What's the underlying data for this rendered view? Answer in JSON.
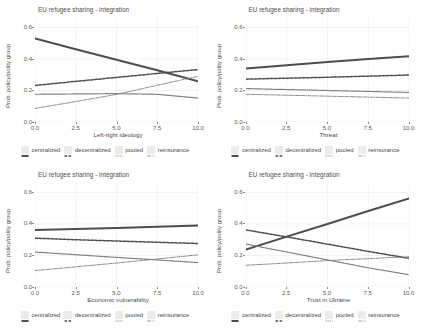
{
  "chart_data": [
    {
      "type": "line",
      "panel": "top-left",
      "title": "EU refugee sharing - integration",
      "xlabel": "Left-right ideology",
      "ylabel": "Prob. policy/polity group",
      "xlim": [
        0,
        10
      ],
      "ylim": [
        0,
        0.66
      ],
      "xticks": [
        "0.0",
        "2.5",
        "5.0",
        "7.5",
        "10.0"
      ],
      "xtickvals": [
        0,
        2.5,
        5,
        7.5,
        10
      ],
      "yticks": [
        "0.0",
        "0.2",
        "0.4",
        "0.6"
      ],
      "ytickvals": [
        0,
        0.2,
        0.4,
        0.6
      ],
      "grid": true,
      "legend_position": "bottom",
      "x": [
        0,
        2.5,
        5,
        7.5,
        10
      ],
      "series": [
        {
          "name": "centralized",
          "style": "solid",
          "values": [
            0.53,
            0.462,
            0.395,
            0.328,
            0.258
          ]
        },
        {
          "name": "decentralized",
          "style": "dashed",
          "values": [
            0.232,
            0.258,
            0.283,
            0.308,
            0.333
          ]
        },
        {
          "name": "pooled",
          "style": "dotted",
          "values": [
            0.176,
            0.178,
            0.18,
            0.176,
            0.152
          ]
        },
        {
          "name": "reinsurance",
          "style": "dashdot",
          "values": [
            0.086,
            0.13,
            0.175,
            0.233,
            0.29
          ]
        }
      ]
    },
    {
      "type": "line",
      "panel": "top-right",
      "title": "EU refugee sharing - integration",
      "xlabel": "Threat",
      "ylabel": "Prob. policy/polity group",
      "xlim": [
        0,
        10
      ],
      "ylim": [
        0,
        0.66
      ],
      "xticks": [
        "0.0",
        "2.5",
        "5.0",
        "7.5",
        "10.0"
      ],
      "xtickvals": [
        0,
        2.5,
        5,
        7.5,
        10
      ],
      "yticks": [
        "0.0",
        "0.2",
        "0.4",
        "0.6"
      ],
      "ytickvals": [
        0,
        0.2,
        0.4,
        0.6
      ],
      "grid": true,
      "legend_position": "bottom",
      "x": [
        0,
        2.5,
        5,
        7.5,
        10
      ],
      "series": [
        {
          "name": "centralized",
          "style": "solid",
          "values": [
            0.34,
            0.36,
            0.38,
            0.4,
            0.418
          ]
        },
        {
          "name": "decentralized",
          "style": "dashed",
          "values": [
            0.272,
            0.278,
            0.284,
            0.291,
            0.298
          ]
        },
        {
          "name": "pooled",
          "style": "dotted",
          "values": [
            0.212,
            0.206,
            0.2,
            0.194,
            0.188
          ]
        },
        {
          "name": "reinsurance",
          "style": "dashdot",
          "values": [
            0.176,
            0.17,
            0.164,
            0.158,
            0.152
          ]
        }
      ]
    },
    {
      "type": "line",
      "panel": "bottom-left",
      "title": "EU refugee sharing - integration",
      "xlabel": "Economic vulnerability",
      "ylabel": "Prob. policy/polity group",
      "xlim": [
        0,
        10
      ],
      "ylim": [
        0,
        0.66
      ],
      "xticks": [
        "0.0",
        "2.5",
        "5.0",
        "7.5",
        "10.0"
      ],
      "xtickvals": [
        0,
        2.5,
        5,
        7.5,
        10
      ],
      "yticks": [
        "0.0",
        "0.2",
        "0.4",
        "0.6"
      ],
      "ytickvals": [
        0,
        0.2,
        0.4,
        0.6
      ],
      "grid": true,
      "legend_position": "bottom",
      "x": [
        0,
        2.5,
        5,
        7.5,
        10
      ],
      "series": [
        {
          "name": "centralized",
          "style": "solid",
          "values": [
            0.362,
            0.368,
            0.375,
            0.382,
            0.39
          ]
        },
        {
          "name": "decentralized",
          "style": "dashed",
          "values": [
            0.31,
            0.3,
            0.292,
            0.284,
            0.276
          ]
        },
        {
          "name": "pooled",
          "style": "dotted",
          "values": [
            0.222,
            0.205,
            0.188,
            0.172,
            0.155
          ]
        },
        {
          "name": "reinsurance",
          "style": "dashdot",
          "values": [
            0.104,
            0.128,
            0.152,
            0.178,
            0.204
          ]
        }
      ]
    },
    {
      "type": "line",
      "panel": "bottom-right",
      "title": "EU refugee sharing - integration",
      "xlabel": "Trust in Ukraine",
      "ylabel": "Prob. policy/polity group",
      "xlim": [
        0,
        10
      ],
      "ylim": [
        0,
        0.66
      ],
      "xticks": [
        "0.0",
        "2.5",
        "5.0",
        "7.5",
        "10.0"
      ],
      "xtickvals": [
        0,
        2.5,
        5,
        7.5,
        10
      ],
      "yticks": [
        "0.0",
        "0.2",
        "0.4",
        "0.6"
      ],
      "ytickvals": [
        0,
        0.2,
        0.4,
        0.6
      ],
      "grid": true,
      "legend_position": "bottom",
      "x": [
        0,
        2.5,
        5,
        7.5,
        10
      ],
      "series": [
        {
          "name": "centralized",
          "style": "solid",
          "values": [
            0.238,
            0.32,
            0.4,
            0.482,
            0.562
          ]
        },
        {
          "name": "decentralized",
          "style": "dashed",
          "values": [
            0.362,
            0.318,
            0.272,
            0.226,
            0.182
          ]
        },
        {
          "name": "pooled",
          "style": "dotted",
          "values": [
            0.272,
            0.222,
            0.172,
            0.122,
            0.078
          ]
        },
        {
          "name": "reinsurance",
          "style": "dashdot",
          "values": [
            0.138,
            0.152,
            0.168,
            0.18,
            0.192
          ]
        }
      ]
    }
  ],
  "legend": {
    "items": [
      {
        "label": "centralized"
      },
      {
        "label": "decentralized"
      },
      {
        "label": "pooled"
      },
      {
        "label": "reinsurance"
      }
    ]
  },
  "colors": {
    "line": "#4d4d4d",
    "line_light": "#7d7d7d",
    "grid": "#f0f0f0",
    "axis_text": "#595959",
    "title_text": "#4a4a4a",
    "legend_key": "#ebebeb",
    "background": "#ffffff"
  }
}
